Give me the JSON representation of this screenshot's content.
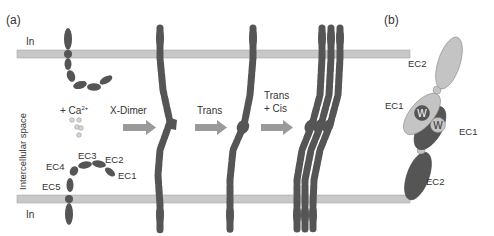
{
  "panel_a": {
    "label": "(a)",
    "top_region": "In",
    "bottom_region": "In",
    "side_label": "Intercellular space",
    "calcium": {
      "prefix": "+ Ca",
      "superscript": "2+"
    },
    "domains": [
      "EC1",
      "EC2",
      "EC3",
      "EC4",
      "EC5"
    ],
    "steps": [
      {
        "arrow_label": "X-Dimer",
        "arrow_label_2": ""
      },
      {
        "arrow_label": "Trans",
        "arrow_label_2": ""
      },
      {
        "arrow_label": "Trans",
        "arrow_label_2": "+ Cis"
      }
    ]
  },
  "panel_b": {
    "label": "(b)",
    "top_ec2": "EC2",
    "left_ec1": "EC1",
    "right_ec1": "EC1",
    "bottom_ec2": "EC2",
    "w1": "W",
    "w2": "W"
  },
  "colors": {
    "membrane": "#c8c8c8",
    "membrane_stroke": "#a8a8a8",
    "protein_dark": "#555555",
    "protein_light": "#c4c4c4",
    "linker": "#d8d8d8",
    "arrow": "#9a9a9a",
    "text": "#333333"
  }
}
